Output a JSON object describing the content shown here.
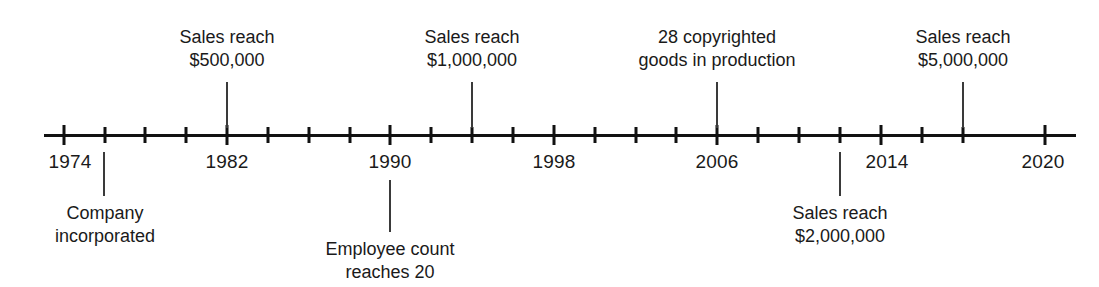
{
  "chart_data": {
    "type": "timeline",
    "title": "",
    "xlabel": "",
    "ylabel": "",
    "axis": {
      "start_year": 1974,
      "end_year": 2020,
      "tick_interval_years": 2,
      "labeled_interval_years": 8,
      "orientation": "horizontal",
      "grid": false,
      "legend": false
    },
    "tick_years": [
      1974,
      1976,
      1978,
      1980,
      1982,
      1984,
      1986,
      1988,
      1990,
      1992,
      1994,
      1996,
      1998,
      2000,
      2002,
      2004,
      2006,
      2008,
      2010,
      2012,
      2014,
      2016,
      2018,
      2020
    ],
    "labeled_years": [
      "1974",
      "1982",
      "1990",
      "1998",
      "2006",
      "2014",
      "2020"
    ],
    "events": [
      {
        "year": 1982,
        "label_lines": [
          "Sales reach",
          "$500,000"
        ],
        "side": "above"
      },
      {
        "year": 1994,
        "label_lines": [
          "Sales reach",
          "$1,000,000"
        ],
        "side": "above"
      },
      {
        "year": 2006,
        "label_lines": [
          "28 copyrighted",
          "goods in production"
        ],
        "side": "above"
      },
      {
        "year": 2018,
        "label_lines": [
          "Sales reach",
          "$5,000,000"
        ],
        "side": "above"
      },
      {
        "year": 1976,
        "label_lines": [
          "Company",
          "incorporated"
        ],
        "side": "below"
      },
      {
        "year": 1990,
        "label_lines": [
          "Employee count",
          "reaches 20"
        ],
        "side": "below"
      },
      {
        "year": 2012,
        "label_lines": [
          "Sales reach",
          "$2,000,000"
        ],
        "side": "below"
      }
    ],
    "colors": {
      "axis": "#111111",
      "leader": "#3a3a3a",
      "text": "#1a1a1a",
      "background": "#ffffff"
    }
  },
  "axis_ticks": [
    {
      "year": "1974",
      "x": 64,
      "major": true
    },
    {
      "year": "1976",
      "x": 105,
      "major": false
    },
    {
      "year": "1978",
      "x": 145,
      "major": false
    },
    {
      "year": "1980",
      "x": 186,
      "major": false
    },
    {
      "year": "1982",
      "x": 227,
      "major": true
    },
    {
      "year": "1984",
      "x": 268,
      "major": false
    },
    {
      "year": "1986",
      "x": 309,
      "major": false
    },
    {
      "year": "1988",
      "x": 350,
      "major": false
    },
    {
      "year": "1990",
      "x": 390,
      "major": true
    },
    {
      "year": "1992",
      "x": 431,
      "major": false
    },
    {
      "year": "1994",
      "x": 472,
      "major": false
    },
    {
      "year": "1996",
      "x": 513,
      "major": false
    },
    {
      "year": "1998",
      "x": 554,
      "major": true
    },
    {
      "year": "2000",
      "x": 595,
      "major": false
    },
    {
      "year": "2002",
      "x": 636,
      "major": false
    },
    {
      "year": "2004",
      "x": 676,
      "major": false
    },
    {
      "year": "2006",
      "x": 717,
      "major": true
    },
    {
      "year": "2008",
      "x": 758,
      "major": false
    },
    {
      "year": "2010",
      "x": 799,
      "major": false
    },
    {
      "year": "2012",
      "x": 840,
      "major": false
    },
    {
      "year": "2014",
      "x": 881,
      "major": true
    },
    {
      "year": "2016",
      "x": 922,
      "major": false
    },
    {
      "year": "2018",
      "x": 963,
      "major": false
    },
    {
      "year": "2020",
      "x": 1045,
      "major": true
    }
  ],
  "year_labels": [
    {
      "text": "1974",
      "x": 70
    },
    {
      "text": "1982",
      "x": 227
    },
    {
      "text": "1990",
      "x": 390
    },
    {
      "text": "1998",
      "x": 554
    },
    {
      "text": "2006",
      "x": 717
    },
    {
      "text": "2014",
      "x": 887
    },
    {
      "text": "2020",
      "x": 1043
    }
  ],
  "callouts_above": [
    {
      "name": "sales-500k",
      "line1": "Sales reach",
      "line2": "$500,000",
      "text_x": 227,
      "text_top": 26,
      "leader_x": 227,
      "leader_top": 82,
      "leader_height": 46
    },
    {
      "name": "sales-1m",
      "line1": "Sales reach",
      "line2": "$1,000,000",
      "text_x": 472,
      "text_top": 26,
      "leader_x": 472,
      "leader_top": 82,
      "leader_height": 46
    },
    {
      "name": "copyrighted-goods",
      "line1": "28 copyrighted",
      "line2": "goods in production",
      "text_x": 717,
      "text_top": 26,
      "leader_x": 717,
      "leader_top": 82,
      "leader_height": 46
    },
    {
      "name": "sales-5m",
      "line1": "Sales reach",
      "line2": "$5,000,000",
      "text_x": 963,
      "text_top": 26,
      "leader_x": 963,
      "leader_top": 82,
      "leader_height": 46
    }
  ],
  "callouts_below": [
    {
      "name": "company-incorporated",
      "line1": "Company",
      "line2": "incorporated",
      "text_x": 105,
      "text_top": 202,
      "leader_x": 104,
      "leader_top": 152,
      "leader_height": 44
    },
    {
      "name": "employee-count",
      "line1": "Employee count",
      "line2": "reaches 20",
      "text_x": 390,
      "text_top": 238,
      "leader_x": 390,
      "leader_top": 180,
      "leader_height": 52
    },
    {
      "name": "sales-2m",
      "line1": "Sales reach",
      "line2": "$2,000,000",
      "text_x": 840,
      "text_top": 202,
      "leader_x": 840,
      "leader_top": 152,
      "leader_height": 44
    }
  ]
}
